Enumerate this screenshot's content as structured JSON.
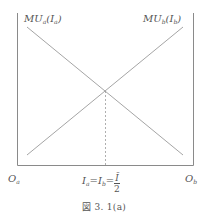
{
  "diagram": {
    "type": "edgeworth-box-marginal-utility",
    "curves": [
      {
        "name": "MU_a",
        "label_main": "MU",
        "label_sub": "a",
        "label_arg_main": "I",
        "label_arg_sub": "a",
        "direction": "decreasing"
      },
      {
        "name": "MU_b",
        "label_main": "MU",
        "label_sub": "b",
        "label_arg_main": "I",
        "label_arg_sub": "b",
        "direction": "increasing"
      }
    ],
    "origins": {
      "left": {
        "main": "O",
        "sub": "a"
      },
      "right": {
        "main": "O",
        "sub": "b"
      }
    },
    "equilibrium_label": {
      "lhs_main": "I",
      "lhs_sub": "a",
      "eq1": "=",
      "mid_main": "I",
      "mid_sub": "b",
      "eq2": "=",
      "frac_num": "Ī",
      "frac_den": "2"
    },
    "caption": "図 3. 1(a)",
    "colors": {
      "axis": "#8a8a8a",
      "line": "#9a9a9a",
      "dashed": "#9a9a9a",
      "text": "#555555"
    }
  }
}
